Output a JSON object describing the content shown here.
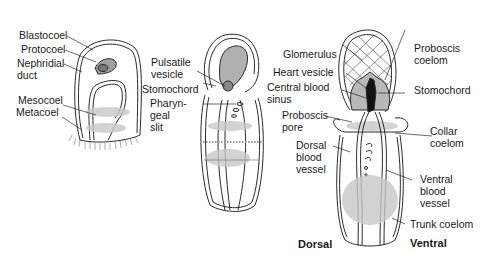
{
  "figure": {
    "panels": [
      {
        "id": "early-larva",
        "labels": {
          "blastocoel": "Blastocoel",
          "protocoel": "Protocoel",
          "nephridial_duct_1": "Nephridial",
          "nephridial_duct_2": "duct",
          "mesocoel": "Mesocoel",
          "metacoel": "Metacoel"
        }
      },
      {
        "id": "late-larva",
        "labels": {
          "pulsatile_vesicle_1": "Pulsatile",
          "pulsatile_vesicle_2": "vesicle",
          "stomochord": "Stomochord",
          "pharyngeal_slit_1": "Pharyn-",
          "pharyngeal_slit_2": "geal",
          "pharyngeal_slit_3": "slit"
        }
      },
      {
        "id": "juvenile",
        "labels": {
          "glomerulus": "Glomerulus",
          "heart_vesicle": "Heart vesicle",
          "central_blood_sinus_1": "Central blood",
          "central_blood_sinus_2": "sinus",
          "proboscis_pore_1": "Proboscis",
          "proboscis_pore_2": "pore",
          "dorsal_blood_vessel_1": "Dorsal",
          "dorsal_blood_vessel_2": "blood",
          "dorsal_blood_vessel_3": "vessel",
          "proboscis_coelom_1": "Proboscis",
          "proboscis_coelom_2": "coelom",
          "stomochord": "Stomochord",
          "collar_coelom_1": "Collar",
          "collar_coelom_2": "coelom",
          "ventral_blood_vessel_1": "Ventral",
          "ventral_blood_vessel_2": "blood",
          "ventral_blood_vessel_3": "vessel",
          "trunk_coelom": "Trunk coelom"
        },
        "orientation": {
          "dorsal": "Dorsal",
          "ventral": "Ventral"
        }
      }
    ],
    "colors": {
      "line": "#2a2a2a",
      "shade": "#bdbdbd",
      "dark": "#111111",
      "background": "#ffffff"
    }
  }
}
